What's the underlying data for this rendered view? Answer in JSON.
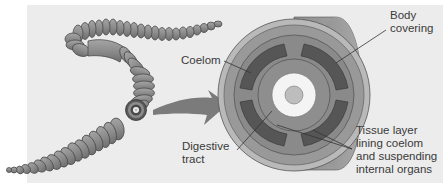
{
  "diagram": {
    "colors": {
      "background": "#ececec",
      "worm_body": "#8a8a8a",
      "body_covering": "#9c9c9c",
      "outer_ring": "#b9b9b9",
      "muscle_ring": "#7f7f7f",
      "coelom": "#565656",
      "gut_white": "#f4f4f4",
      "lumen": "#bdbdbd",
      "arrow": "#7b7b7b",
      "leader_line": "#333333",
      "text": "#3a3a3a"
    },
    "labels": {
      "coelom": "Coelom",
      "body_covering": "Body\ncovering",
      "digestive_tract": "Digestive\ntract",
      "tissue_layer": "Tissue layer\nlining coelom\nand suspending\ninternal organs"
    }
  }
}
